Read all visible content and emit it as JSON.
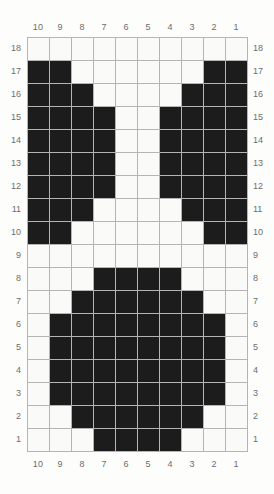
{
  "chart_data": {
    "type": "heatmap",
    "title": "Knitting / cross-stitch colorwork chart",
    "xlabel": "",
    "ylabel": "",
    "grid": true,
    "legend_position": "none",
    "columns": 10,
    "rows": 18,
    "column_labels_top": [
      "10",
      "9",
      "8",
      "7",
      "6",
      "5",
      "4",
      "3",
      "2",
      "1"
    ],
    "column_labels_bottom": [
      "10",
      "9",
      "8",
      "7",
      "6",
      "5",
      "4",
      "3",
      "2",
      "1"
    ],
    "row_labels_left": [
      "18",
      "17",
      "16",
      "15",
      "14",
      "13",
      "12",
      "11",
      "10",
      "9",
      "8",
      "7",
      "6",
      "5",
      "4",
      "3",
      "2",
      "1"
    ],
    "row_labels_right": [
      "18",
      "17",
      "16",
      "15",
      "14",
      "13",
      "12",
      "11",
      "10",
      "9",
      "8",
      "7",
      "6",
      "5",
      "4",
      "3",
      "2",
      "1"
    ],
    "colors": {
      "filled": "#1c1c1c",
      "empty": "#fafaf8",
      "gridline": "#b5b5b5",
      "label": "#6d6d6d",
      "background": "#fdfdfc"
    },
    "value_legend": {
      "1": "filled stitch (dark)",
      "0": "empty stitch (light)"
    },
    "matrix_row_order": "top row is row 18, bottom row is row 1",
    "matrix_column_order": "left column is column 10, right column is column 1",
    "matrix": [
      [
        0,
        0,
        0,
        0,
        0,
        0,
        0,
        0,
        0,
        0
      ],
      [
        1,
        1,
        0,
        0,
        0,
        0,
        0,
        0,
        1,
        1
      ],
      [
        1,
        1,
        1,
        0,
        0,
        0,
        0,
        1,
        1,
        1
      ],
      [
        1,
        1,
        1,
        1,
        0,
        0,
        1,
        1,
        1,
        1
      ],
      [
        1,
        1,
        1,
        1,
        0,
        0,
        1,
        1,
        1,
        1
      ],
      [
        1,
        1,
        1,
        1,
        0,
        0,
        1,
        1,
        1,
        1
      ],
      [
        1,
        1,
        1,
        1,
        0,
        0,
        1,
        1,
        1,
        1
      ],
      [
        1,
        1,
        1,
        0,
        0,
        0,
        0,
        1,
        1,
        1
      ],
      [
        1,
        1,
        0,
        0,
        0,
        0,
        0,
        0,
        1,
        1
      ],
      [
        0,
        0,
        0,
        0,
        0,
        0,
        0,
        0,
        0,
        0
      ],
      [
        0,
        0,
        0,
        1,
        1,
        1,
        1,
        0,
        0,
        0
      ],
      [
        0,
        0,
        1,
        1,
        1,
        1,
        1,
        1,
        0,
        0
      ],
      [
        0,
        1,
        1,
        1,
        1,
        1,
        1,
        1,
        1,
        0
      ],
      [
        0,
        1,
        1,
        1,
        1,
        1,
        1,
        1,
        1,
        0
      ],
      [
        0,
        1,
        1,
        1,
        1,
        1,
        1,
        1,
        1,
        0
      ],
      [
        0,
        1,
        1,
        1,
        1,
        1,
        1,
        1,
        1,
        0
      ],
      [
        0,
        0,
        1,
        1,
        1,
        1,
        1,
        1,
        0,
        0
      ],
      [
        0,
        0,
        0,
        1,
        1,
        1,
        1,
        0,
        0,
        0
      ]
    ]
  }
}
